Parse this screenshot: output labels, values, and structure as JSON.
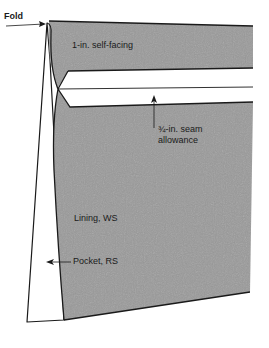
{
  "diagram": {
    "type": "sewing-illustration",
    "colors": {
      "fabric_fill": "#9a9a9a",
      "outline": "#1a1a1a",
      "background": "#ffffff",
      "band": "#ffffff"
    },
    "labels": {
      "fold": "Fold",
      "self_facing": "1-in. self-facing",
      "seam_allowance_line1": "¾-in. seam",
      "seam_allowance_line2": "allowance",
      "lining": "Lining, WS",
      "pocket": "Pocket, RS"
    }
  }
}
